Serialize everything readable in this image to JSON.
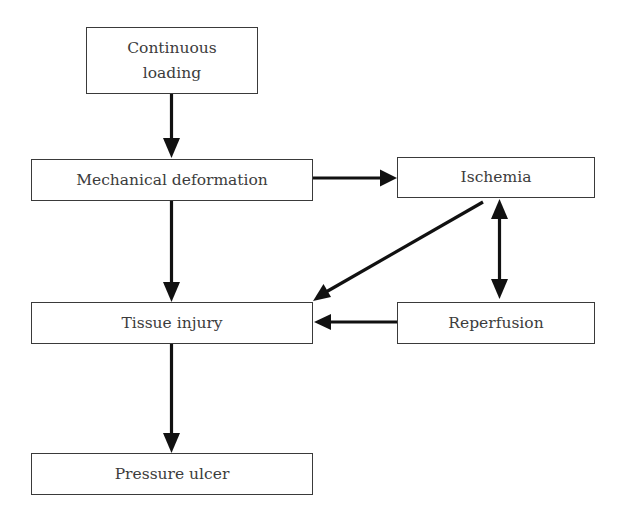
{
  "diagram": {
    "title": "",
    "nodes": [
      {
        "id": "continuous-loading",
        "line1": "Continuous",
        "line2": "loading"
      },
      {
        "id": "mechanical-deformation",
        "label": "Mechanical deformation"
      },
      {
        "id": "ischemia",
        "label": "Ischemia"
      },
      {
        "id": "tissue-injury",
        "label": "Tissue injury"
      },
      {
        "id": "reperfusion",
        "label": "Reperfusion"
      },
      {
        "id": "pressure-ulcer",
        "label": "Pressure ulcer"
      }
    ],
    "edges": [
      {
        "from": "continuous-loading",
        "to": "mechanical-deformation",
        "type": "directed"
      },
      {
        "from": "mechanical-deformation",
        "to": "ischemia",
        "type": "directed"
      },
      {
        "from": "mechanical-deformation",
        "to": "tissue-injury",
        "type": "directed"
      },
      {
        "from": "ischemia",
        "to": "tissue-injury",
        "type": "directed"
      },
      {
        "from": "ischemia",
        "to": "reperfusion",
        "type": "bidirectional"
      },
      {
        "from": "reperfusion",
        "to": "tissue-injury",
        "type": "directed"
      },
      {
        "from": "tissue-injury",
        "to": "pressure-ulcer",
        "type": "directed"
      }
    ],
    "colors": {
      "stroke": "#111111",
      "border": "#3a3a3a",
      "text": "#3c3c3c",
      "background": "#ffffff"
    }
  }
}
